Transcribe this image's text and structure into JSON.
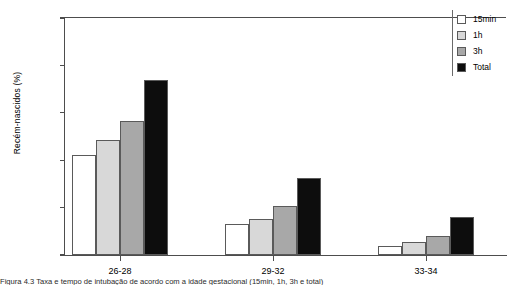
{
  "chart_data": {
    "type": "bar",
    "title": "",
    "xlabel": "",
    "ylabel": "Recém-nascidos (%)",
    "ylim": [
      0,
      100
    ],
    "yticks": [
      0,
      20,
      40,
      60,
      80,
      100
    ],
    "grid": false,
    "legend_position": "top-right",
    "categories": [
      "26-28",
      "29-32",
      "33-34"
    ],
    "series": [
      {
        "name": "15min",
        "color": "#ffffff",
        "values": [
          42,
          13,
          4
        ]
      },
      {
        "name": "1h",
        "color": "#d8d8d8",
        "values": [
          48.5,
          15,
          5.5
        ]
      },
      {
        "name": "3h",
        "color": "#a8a8a8",
        "values": [
          56.5,
          20.5,
          8
        ]
      },
      {
        "name": "Total",
        "color": "#0d0d0d",
        "values": [
          74,
          32.5,
          16
        ]
      }
    ]
  },
  "caption": {
    "text": "Figura 4.3 Taxa e tempo de intubação de acordo com a idade gestacional (15min, 1h, 3h e total)"
  },
  "colors": {
    "axis": "#4d4d4d",
    "bar_outline": "#5a5a5a",
    "text": "#000000"
  }
}
